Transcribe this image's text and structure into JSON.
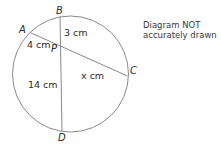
{
  "diagram": {
    "type": "circle-intersecting-chords",
    "points": {
      "A": {
        "label": "A"
      },
      "B": {
        "label": "B"
      },
      "C": {
        "label": "C"
      },
      "D": {
        "label": "D"
      },
      "P": {
        "label": "P"
      }
    },
    "segments": {
      "AP": {
        "label": "4 cm"
      },
      "BP": {
        "label": "3 cm"
      },
      "PC": {
        "label": "x cm"
      },
      "PD": {
        "label": "14 cm"
      }
    },
    "note_line1": "Diagram NOT",
    "note_line2": "accurately drawn"
  }
}
